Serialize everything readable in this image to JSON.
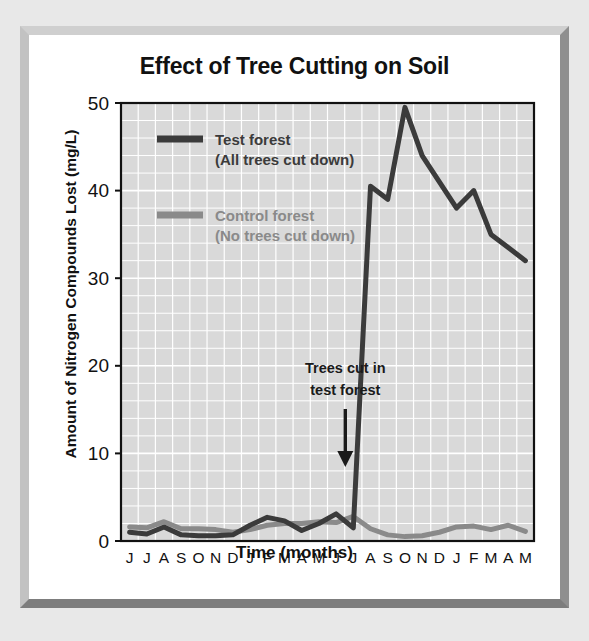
{
  "figure": {
    "title": "Effect of Tree Cutting on Soil",
    "xlabel": "Time (months)",
    "ylabel": "Amount of Nitrogen Compounds Lost (mg/L)",
    "frame_color": "#c2c2c2",
    "background_color": "#e8e8e8",
    "plot_background_color": "#d9d9d9",
    "grid_color": "#ffffff",
    "axis_color": "#111111"
  },
  "legend": {
    "position": "top-left-inside",
    "entries": [
      {
        "name": "test-forest",
        "label": "Test forest",
        "sublabel": "(All trees cut down)",
        "color": "#3b3b3b"
      },
      {
        "name": "control-forest",
        "label": "Control forest",
        "sublabel": "(No trees cut down)",
        "color": "#8a8a8a"
      }
    ]
  },
  "annotation": {
    "line1": "Trees cut in",
    "line2": "test forest",
    "arrow": "down-arrow",
    "at_month_index": 13
  },
  "chart_data": {
    "type": "line",
    "title": "Effect of Tree Cutting on Soil",
    "xlabel": "Time (months)",
    "ylabel": "Amount of Nitrogen Compounds Lost (mg/L)",
    "categories": [
      "J",
      "J",
      "A",
      "S",
      "O",
      "N",
      "D",
      "J",
      "F",
      "M",
      "A",
      "M",
      "J",
      "J",
      "A",
      "S",
      "O",
      "N",
      "D",
      "J",
      "F",
      "M",
      "A",
      "M"
    ],
    "ylim": [
      0,
      50
    ],
    "yticks": [
      0,
      10,
      20,
      30,
      40,
      50
    ],
    "y_minor_step": 2,
    "grid": true,
    "legend_position": "upper left",
    "series": [
      {
        "name": "Test forest",
        "style": "solid",
        "color": "#3b3b3b",
        "values": [
          1.0,
          0.8,
          1.6,
          0.7,
          0.6,
          0.6,
          0.7,
          1.8,
          2.7,
          2.3,
          1.2,
          2.0,
          3.1,
          1.5,
          40.5,
          39.0,
          49.5,
          44.0,
          41.0,
          38.0,
          40.0,
          35.0,
          33.5,
          32.0
        ]
      },
      {
        "name": "Control forest",
        "style": "solid",
        "color": "#8a8a8a",
        "values": [
          1.6,
          1.5,
          2.2,
          1.4,
          1.4,
          1.3,
          1.0,
          1.3,
          1.8,
          2.0,
          2.0,
          2.2,
          2.1,
          2.8,
          1.4,
          0.7,
          0.5,
          0.6,
          1.0,
          1.6,
          1.7,
          1.3,
          1.8,
          1.1
        ]
      }
    ]
  }
}
